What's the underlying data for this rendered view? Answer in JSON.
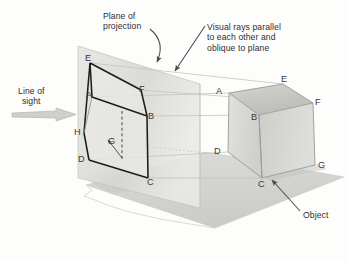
{
  "figure": {
    "background_color": "#fdfdfc",
    "text_color": "#2e2e2e"
  },
  "annotations": {
    "plane_of_projection": {
      "line1": "Plane of",
      "line2": "projection",
      "arrow": "curved-arrow-down-left"
    },
    "visual_rays": {
      "line1": "Visual rays parallel",
      "line2": "to each other and",
      "line3": "oblique to plane",
      "arrow": "straight-arrow-down-left"
    },
    "line_of_sight": {
      "line1": "Line of",
      "line2": "sight",
      "arrow": "block-arrow-right"
    },
    "object": {
      "label": "Object",
      "arrow": "straight-arrow-up-left"
    }
  },
  "projected_image": {
    "name": "projected-view-on-plane",
    "vertices": [
      {
        "id": "E",
        "x": 90,
        "y": 63
      },
      {
        "id": "A",
        "x": 92,
        "y": 97
      },
      {
        "id": "F",
        "x": 141,
        "y": 90
      },
      {
        "id": "B",
        "x": 147,
        "y": 116
      },
      {
        "id": "H",
        "x": 84,
        "y": 133
      },
      {
        "id": "G",
        "x": 115,
        "y": 143
      },
      {
        "id": "D",
        "x": 89,
        "y": 160
      },
      {
        "id": "C",
        "x": 148,
        "y": 178
      }
    ]
  },
  "object_cube": {
    "name": "cube-object",
    "vertices": [
      {
        "id": "A",
        "x": 229,
        "y": 93
      },
      {
        "id": "E",
        "x": 283,
        "y": 84
      },
      {
        "id": "B",
        "x": 259,
        "y": 115
      },
      {
        "id": "F",
        "x": 313,
        "y": 103
      },
      {
        "id": "D",
        "x": 228,
        "y": 152
      },
      {
        "id": "C",
        "x": 262,
        "y": 178
      },
      {
        "id": "G",
        "x": 315,
        "y": 165
      }
    ],
    "face_colors": {
      "top": "#c9c9c6",
      "left": "#d9d9d6",
      "right": "#cfcfcc"
    }
  },
  "plane": {
    "name": "plane-of-projection-surface",
    "fill": "#dededa"
  },
  "ground": {
    "name": "ground-plane",
    "fill": "#d2d2ce"
  },
  "visual_rays": {
    "count": 5,
    "stroke": "#c4c4c0",
    "description": "thin parallel lines connecting object vertices to their projections"
  }
}
